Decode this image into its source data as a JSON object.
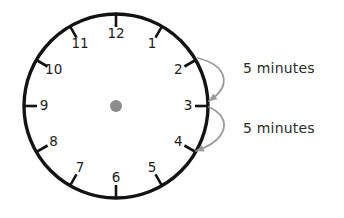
{
  "diagram": {
    "type": "clock-face",
    "background_color": "#ffffff",
    "clock": {
      "center_x": 116,
      "center_y": 106,
      "radius": 92,
      "rim_color": "#131313",
      "rim_width": 3.4,
      "hub": {
        "name": "center-hub",
        "radius": 6,
        "color": "#8c8c8c"
      },
      "tick": {
        "color": "#131313",
        "width": 2.6,
        "length": 12
      },
      "numeral_color": "#1b1b1b",
      "hour_marks": [
        {
          "hour": "12",
          "angle_deg": 0,
          "label_radius": 72
        },
        {
          "hour": "1",
          "angle_deg": 30,
          "label_radius": 72
        },
        {
          "hour": "2",
          "angle_deg": 60,
          "label_radius": 72
        },
        {
          "hour": "3",
          "angle_deg": 90,
          "label_radius": 72
        },
        {
          "hour": "4",
          "angle_deg": 120,
          "label_radius": 72
        },
        {
          "hour": "5",
          "angle_deg": 150,
          "label_radius": 72
        },
        {
          "hour": "6",
          "angle_deg": 180,
          "label_radius": 72
        },
        {
          "hour": "7",
          "angle_deg": 210,
          "label_radius": 72
        },
        {
          "hour": "8",
          "angle_deg": 240,
          "label_radius": 72
        },
        {
          "hour": "9",
          "angle_deg": 270,
          "label_radius": 72
        },
        {
          "hour": "10",
          "angle_deg": 300,
          "label_radius": 72
        },
        {
          "hour": "11",
          "angle_deg": 330,
          "label_radius": 72
        }
      ]
    },
    "annotations": [
      {
        "name": "five-minutes-2-to-3",
        "label": "5 minutes",
        "from_hour": "2",
        "to_hour": "3",
        "arrow_color": "#9a9a9a",
        "label_x": 243,
        "label_y": 69,
        "path": "M 198 58 C 228 66 232 86 209 101",
        "arrow_tip_x": 209,
        "arrow_tip_y": 101
      },
      {
        "name": "five-minutes-3-to-4",
        "label": "5 minutes",
        "from_hour": "3",
        "to_hour": "4",
        "arrow_color": "#9a9a9a",
        "label_x": 243,
        "label_y": 129,
        "path": "M 209 107 C 233 118 228 140 196 151",
        "arrow_tip_x": 196,
        "arrow_tip_y": 151
      }
    ]
  }
}
